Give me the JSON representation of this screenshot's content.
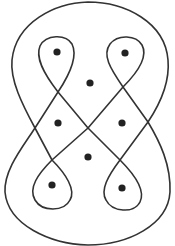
{
  "diagram": {
    "stroke_color": "#333333",
    "dot_color": "#222222",
    "background": "#ffffff",
    "curve_count": 1,
    "dot_count": 8,
    "crossing_count": 7,
    "dots": [
      {
        "id": "top-left-loop",
        "x": 57,
        "y": 52
      },
      {
        "id": "top-right-loop",
        "x": 125,
        "y": 53
      },
      {
        "id": "upper-center",
        "x": 90,
        "y": 83
      },
      {
        "id": "mid-left",
        "x": 58,
        "y": 123
      },
      {
        "id": "mid-right",
        "x": 122,
        "y": 123
      },
      {
        "id": "lower-center",
        "x": 88,
        "y": 157
      },
      {
        "id": "bottom-left-loop",
        "x": 52,
        "y": 185
      },
      {
        "id": "bottom-right-loop",
        "x": 122,
        "y": 188
      }
    ]
  }
}
